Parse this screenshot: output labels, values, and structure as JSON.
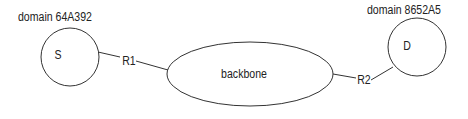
{
  "diagram": {
    "nodes": [
      {
        "id": "S",
        "label": "S",
        "domain_label": "domain 64A392",
        "shape": "circle"
      },
      {
        "id": "backbone",
        "label": "backbone",
        "shape": "ellipse"
      },
      {
        "id": "D",
        "label": "D",
        "domain_label": "domain 8652A5",
        "shape": "circle"
      }
    ],
    "edges": [
      {
        "from": "S",
        "to": "backbone",
        "label": "R1"
      },
      {
        "from": "backbone",
        "to": "D",
        "label": "R2"
      }
    ],
    "colors": {
      "stroke": "#333333",
      "text": "#222222",
      "background": "#ffffff"
    }
  }
}
